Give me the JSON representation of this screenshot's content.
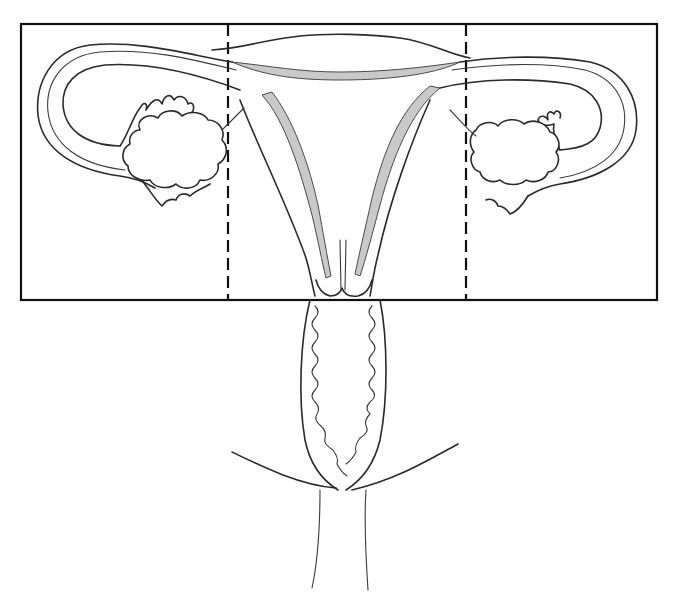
{
  "diagram": {
    "colors": {
      "line": "#2a2a2a",
      "frame": "#111111",
      "endometrium_shade": "#c9c9c9",
      "background": "#ffffff"
    },
    "frame": {
      "x": 21,
      "y": 24,
      "width": 636,
      "height": 276
    },
    "dividers": [
      {
        "x": 228,
        "style": "dashed"
      },
      {
        "x": 466,
        "style": "dashed"
      }
    ],
    "regions": [
      {
        "id": "left",
        "contents": [
          "left fallopian tube",
          "left ovary",
          "left fimbriae"
        ]
      },
      {
        "id": "center",
        "contents": [
          "uterine fundus",
          "uterine cavity",
          "cervix"
        ]
      },
      {
        "id": "right",
        "contents": [
          "right fallopian tube",
          "right ovary",
          "right fimbriae"
        ]
      }
    ],
    "below_frame": [
      "vagina",
      "vaginal rugae",
      "vulva outline"
    ],
    "labels": []
  }
}
